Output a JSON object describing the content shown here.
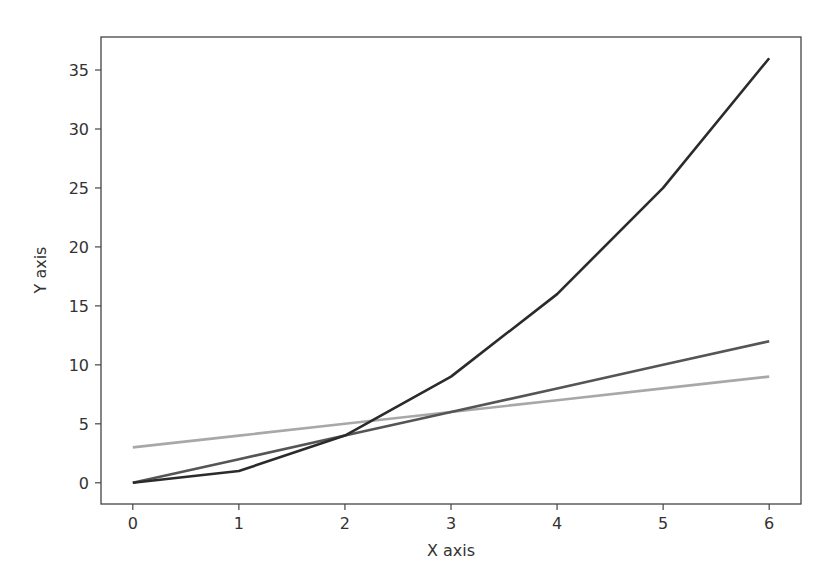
{
  "chart_data": {
    "type": "line",
    "title": "",
    "xlabel": "X axis",
    "ylabel": "Y axis",
    "x": [
      0,
      1,
      2,
      3,
      4,
      5,
      6
    ],
    "series": [
      {
        "name": "y = x^2",
        "values": [
          0,
          1,
          4,
          9,
          16,
          25,
          36
        ],
        "color": "#2b2b2b"
      },
      {
        "name": "y = 2x",
        "values": [
          0,
          2,
          4,
          6,
          8,
          10,
          12
        ],
        "color": "#555555"
      },
      {
        "name": "y = x + 3",
        "values": [
          3,
          4,
          5,
          6,
          7,
          8,
          9
        ],
        "color": "#a8a8a8"
      }
    ],
    "xticks": [
      0,
      1,
      2,
      3,
      4,
      5,
      6
    ],
    "yticks": [
      0,
      5,
      10,
      15,
      20,
      25,
      30,
      35
    ],
    "xlim": [
      -0.3,
      6.3
    ],
    "ylim": [
      -1.8,
      37.8
    ],
    "grid": false,
    "legend": null
  },
  "axes": {
    "xlabel": "X axis",
    "ylabel": "Y axis"
  }
}
